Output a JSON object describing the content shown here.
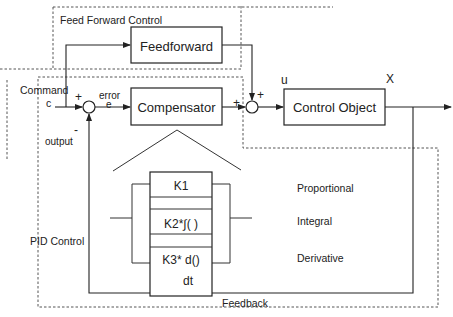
{
  "diagram": {
    "regions": {
      "feed_forward": "Feed Forward Control",
      "pid": "PID Control",
      "feedback": "Feedback"
    },
    "blocks": {
      "feedforward": "Feedforward",
      "compensator": "Compensator",
      "control_object": "Control Object"
    },
    "signals": {
      "command": "Command",
      "command_symbol": "c",
      "error": "error",
      "error_symbol": "e",
      "output": "output",
      "u": "u",
      "x": "X"
    },
    "signs": {
      "sum1_plus": "+",
      "sum1_minus": "-",
      "sum2_plus_left": "+",
      "sum2_plus_top": "+"
    },
    "pid_terms": {
      "k1": "K1",
      "k2": "K2*∫( )",
      "k3_top": "K3*  d()",
      "k3_bottom": "dt",
      "proportional": "Proportional",
      "integral": "Integral",
      "derivative": "Derivative"
    }
  }
}
